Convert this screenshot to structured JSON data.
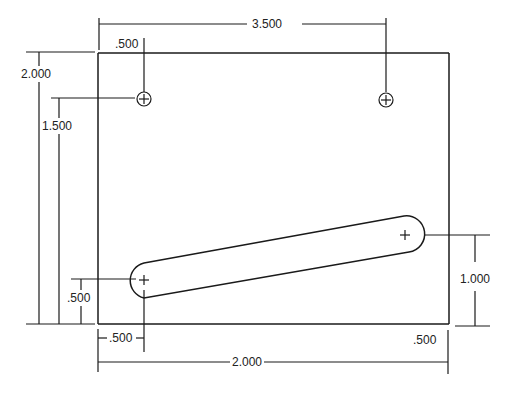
{
  "drawing": {
    "title": "Plate with mounting holes and angled slot",
    "units": "inch",
    "line_color": "#1a1a1a",
    "background": "#ffffff"
  },
  "dimensions": {
    "top_hole_spacing": "3.500",
    "top_left_hole_from_left": ".500",
    "overall_height": "2.000",
    "hole_height_from_bottom": "1.500",
    "slot_left_height": ".500",
    "slot_right_height": "1.000",
    "slot_left_from_left": ".500",
    "slot_right_from_right": ".500",
    "slot_horizontal_span": "2.000"
  },
  "features": {
    "holes": [
      {
        "name": "top-left-hole",
        "symbol": "circle-plus"
      },
      {
        "name": "top-right-hole",
        "symbol": "circle-plus"
      }
    ],
    "slot": {
      "name": "angled-slot",
      "ends": [
        "left-center-mark",
        "right-center-mark"
      ]
    }
  }
}
